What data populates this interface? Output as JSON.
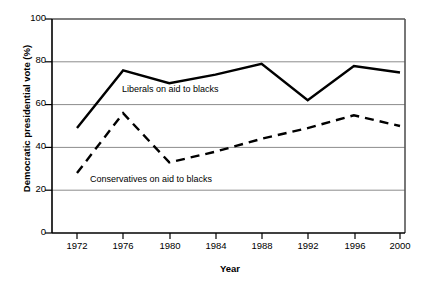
{
  "chart_data": {
    "type": "line",
    "title": "",
    "xlabel": "Year",
    "ylabel": "Democratic presidential vote (%)",
    "x": [
      1972,
      1976,
      1980,
      1984,
      1988,
      1992,
      1996,
      2000
    ],
    "xtick_labels": [
      "1972",
      "1976",
      "1980",
      "1984",
      "1988",
      "1992",
      "1996",
      "2000"
    ],
    "ytick_labels": [
      "0",
      "20",
      "40",
      "60",
      "80",
      "100"
    ],
    "ytick_values": [
      0,
      20,
      40,
      60,
      80,
      100
    ],
    "ylim": [
      0,
      100
    ],
    "xlim": [
      1970,
      2002
    ],
    "grid": "horizontal",
    "legend_position": "inline-annotations",
    "series": [
      {
        "name": "Liberals on aid to blacks",
        "style": "solid",
        "color": "#000000",
        "values": [
          49,
          76,
          70,
          74,
          79,
          62,
          78,
          75
        ]
      },
      {
        "name": "Conservatives on aid to blacks",
        "style": "dashed",
        "color": "#000000",
        "values": [
          28,
          56,
          33,
          38,
          44,
          49,
          55,
          50
        ]
      }
    ],
    "annotations": [
      {
        "text": "Liberals on aid to blacks",
        "x": 1978.6,
        "y": 67
      },
      {
        "text": "Conservatives on aid to blacks",
        "x": 1981.5,
        "y": 28
      }
    ]
  }
}
